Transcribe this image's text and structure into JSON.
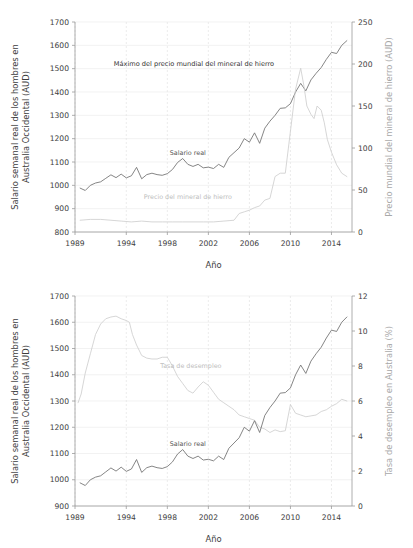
{
  "figure": {
    "xlabel": "Año",
    "ylabel_left": [
      "Salario semanal  real de los hombres en",
      "Australia Occidental  (AUD)"
    ]
  },
  "chart_data": [
    {
      "id": "top",
      "type": "line",
      "title": "",
      "xlabel": "Año",
      "ylabel": "Salario semanal  real de los hombres en Australia Occidental  (AUD)",
      "ylabel_right": "Precio mundial del mineral de hierro (AUD)",
      "xlim": [
        1989,
        2016
      ],
      "ylim": [
        800,
        1700
      ],
      "ylim_right": [
        0,
        250
      ],
      "xticks": [
        1989,
        1994,
        1998,
        2002,
        2006,
        2010,
        2014
      ],
      "yticks": [
        800,
        900,
        1000,
        1100,
        1200,
        1300,
        1400,
        1500,
        1600,
        1700
      ],
      "yticks_right": [
        0,
        50,
        100,
        150,
        200,
        250
      ],
      "grid": true,
      "annotations": [
        {
          "text": "Máximo del precio mundial del mineral de hierro",
          "x": 2000.6,
          "y": 1510
        }
      ],
      "series": [
        {
          "name": "Salario real",
          "axis": "left",
          "color": "#6f6f6f",
          "label_x": 2000.0,
          "label_y": 1128,
          "x": [
            1989.5,
            1990.0,
            1990.5,
            1991.0,
            1991.5,
            1992.0,
            1992.5,
            1993.0,
            1993.5,
            1994.0,
            1994.5,
            1995.0,
            1995.5,
            1996.0,
            1996.5,
            1997.0,
            1997.5,
            1998.0,
            1998.5,
            1999.0,
            1999.5,
            2000.0,
            2000.5,
            2001.0,
            2001.5,
            2002.0,
            2002.5,
            2003.0,
            2003.5,
            2004.0,
            2004.5,
            2005.0,
            2005.5,
            2006.0,
            2006.5,
            2007.0,
            2007.5,
            2008.0,
            2008.5,
            2009.0,
            2009.5,
            2010.0,
            2010.5,
            2011.0,
            2011.5,
            2012.0,
            2012.5,
            2013.0,
            2013.5,
            2014.0,
            2014.5,
            2015.0,
            2015.5
          ],
          "y": [
            988,
            978,
            1000,
            1010,
            1015,
            1030,
            1045,
            1033,
            1048,
            1032,
            1041,
            1077,
            1028,
            1046,
            1052,
            1046,
            1043,
            1050,
            1068,
            1098,
            1115,
            1090,
            1081,
            1090,
            1075,
            1078,
            1072,
            1090,
            1077,
            1120,
            1140,
            1160,
            1200,
            1185,
            1225,
            1180,
            1245,
            1275,
            1300,
            1330,
            1332,
            1350,
            1400,
            1437,
            1405,
            1452,
            1480,
            1505,
            1540,
            1570,
            1565,
            1600,
            1620
          ]
        },
        {
          "name": "Precio del mineral de hierro",
          "axis": "right",
          "color": "#cfcfcf",
          "label_x": 2000.0,
          "label_y": 940,
          "x": [
            1989.5,
            1990.5,
            1991.5,
            1992.5,
            1993.5,
            1994.5,
            1995.5,
            1996.5,
            1997.5,
            1998.5,
            1999.5,
            2000.5,
            2001.5,
            2002.5,
            2003.5,
            2004.5,
            2005.0,
            2005.5,
            2006.0,
            2006.5,
            2007.0,
            2007.5,
            2008.0,
            2008.5,
            2009.0,
            2009.5,
            2010.0,
            2010.5,
            2011.0,
            2011.3,
            2011.6,
            2012.0,
            2012.3,
            2012.6,
            2013.0,
            2013.3,
            2013.6,
            2014.0,
            2014.5,
            2015.0,
            2015.5
          ],
          "y": [
            14,
            15,
            15,
            14,
            13,
            12,
            13,
            12,
            12,
            12,
            12,
            12,
            12,
            12,
            13,
            14,
            22,
            24,
            26,
            29,
            31,
            38,
            40,
            66,
            70,
            70,
            120,
            170,
            195,
            175,
            150,
            140,
            135,
            150,
            145,
            130,
            110,
            95,
            80,
            70,
            66
          ]
        }
      ]
    },
    {
      "id": "bottom",
      "type": "line",
      "title": "",
      "xlabel": "Año",
      "ylabel": "Salario semanal real de los hombres en Australia Occidental (AUD)",
      "ylabel_right": "Tasa de desempleo en Australia (%)",
      "xlim": [
        1989,
        2016
      ],
      "ylim": [
        900,
        1700
      ],
      "ylim_right": [
        0,
        12
      ],
      "xticks": [
        1989,
        1994,
        1998,
        2002,
        2006,
        2010,
        2014
      ],
      "yticks": [
        900,
        1000,
        1100,
        1200,
        1300,
        1400,
        1500,
        1600,
        1700
      ],
      "yticks_right": [
        0,
        2,
        4,
        6,
        8,
        10,
        12
      ],
      "grid": true,
      "annotations": [],
      "series": [
        {
          "name": "Tasa de desempleo",
          "axis": "right",
          "color": "#cfcfcf",
          "label_x": 2000.3,
          "label_y": 1425,
          "x": [
            1989.3,
            1989.6,
            1990.0,
            1990.5,
            1991.0,
            1991.5,
            1992.0,
            1992.5,
            1993.0,
            1993.5,
            1994.0,
            1994.3,
            1994.6,
            1995.0,
            1995.5,
            1996.0,
            1996.5,
            1997.0,
            1997.5,
            1998.0,
            1998.5,
            1999.0,
            1999.5,
            2000.0,
            2000.5,
            2001.0,
            2001.5,
            2002.0,
            2002.5,
            2003.0,
            2003.5,
            2004.0,
            2004.5,
            2005.0,
            2005.5,
            2006.0,
            2006.5,
            2007.0,
            2007.5,
            2008.0,
            2008.5,
            2009.0,
            2009.5,
            2010.0,
            2010.5,
            2011.0,
            2011.5,
            2012.0,
            2012.5,
            2013.0,
            2013.5,
            2014.0,
            2014.5,
            2015.0,
            2015.5
          ],
          "y": [
            5.9,
            6.4,
            7.6,
            8.7,
            9.8,
            10.4,
            10.7,
            10.8,
            10.85,
            10.7,
            10.6,
            10.5,
            9.8,
            9.2,
            8.6,
            8.45,
            8.4,
            8.4,
            8.5,
            8.5,
            8.0,
            7.4,
            7.0,
            6.6,
            6.45,
            6.8,
            7.1,
            6.9,
            6.5,
            6.1,
            5.9,
            5.7,
            5.5,
            5.2,
            5.1,
            5.0,
            4.9,
            4.5,
            4.4,
            4.2,
            4.35,
            4.25,
            4.3,
            5.8,
            5.3,
            5.2,
            5.1,
            5.15,
            5.2,
            5.4,
            5.5,
            5.7,
            5.85,
            6.1,
            6.0
          ]
        },
        {
          "name": "Salario real",
          "axis": "left",
          "color": "#6f6f6f",
          "label_x": 2000.0,
          "label_y": 1128,
          "x": [
            1989.5,
            1990.0,
            1990.5,
            1991.0,
            1991.5,
            1992.0,
            1992.5,
            1993.0,
            1993.5,
            1994.0,
            1994.5,
            1995.0,
            1995.5,
            1996.0,
            1996.5,
            1997.0,
            1997.5,
            1998.0,
            1998.5,
            1999.0,
            1999.5,
            2000.0,
            2000.5,
            2001.0,
            2001.5,
            2002.0,
            2002.5,
            2003.0,
            2003.5,
            2004.0,
            2004.5,
            2005.0,
            2005.5,
            2006.0,
            2006.5,
            2007.0,
            2007.5,
            2008.0,
            2008.5,
            2009.0,
            2009.5,
            2010.0,
            2010.5,
            2011.0,
            2011.5,
            2012.0,
            2012.5,
            2013.0,
            2013.5,
            2014.0,
            2014.5,
            2015.0,
            2015.5
          ],
          "y": [
            988,
            978,
            1000,
            1010,
            1015,
            1030,
            1045,
            1033,
            1048,
            1032,
            1041,
            1077,
            1028,
            1046,
            1052,
            1046,
            1043,
            1050,
            1068,
            1098,
            1115,
            1090,
            1081,
            1090,
            1075,
            1078,
            1072,
            1090,
            1077,
            1120,
            1140,
            1160,
            1200,
            1185,
            1225,
            1180,
            1245,
            1275,
            1300,
            1330,
            1332,
            1350,
            1400,
            1437,
            1405,
            1452,
            1480,
            1505,
            1540,
            1570,
            1565,
            1600,
            1620
          ]
        }
      ]
    }
  ]
}
